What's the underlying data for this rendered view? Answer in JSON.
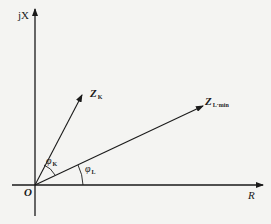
{
  "diagram": {
    "title": "",
    "axes": {
      "vertical_label": "jX",
      "horizontal_label": "R",
      "origin_label": "O"
    },
    "vectors": [
      {
        "name": "Z",
        "subscript": "K"
      },
      {
        "name": "Z",
        "subscript": "L·min"
      }
    ],
    "angles": [
      {
        "symbol": "φ",
        "subscript": "K"
      },
      {
        "symbol": "φ",
        "subscript": "L"
      }
    ],
    "colors": {
      "line": "#1a1a1a",
      "background": "#f4f4f2"
    }
  }
}
